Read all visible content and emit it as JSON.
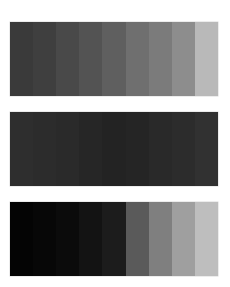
{
  "figure": {
    "background": "#ffffff",
    "strips": [
      {
        "name": "top-gray-ramp",
        "top": 22,
        "bands": [
          "#3a3a3a",
          "#3f3f3f",
          "#494949",
          "#535353",
          "#5f5f5f",
          "#6f6f6f",
          "#7b7b7b",
          "#8d8d8d",
          "#b9b9b9"
        ]
      },
      {
        "name": "middle-dark-ramp",
        "top": 112,
        "bands": [
          "#2e2e2e",
          "#2c2c2c",
          "#2a2a2a",
          "#262626",
          "#232323",
          "#252525",
          "#292929",
          "#2c2c2c",
          "#313131"
        ]
      },
      {
        "name": "bottom-black-to-light-ramp",
        "top": 202,
        "bands": [
          "#040404",
          "#070707",
          "#0b0b0b",
          "#131313",
          "#1c1c1c",
          "#5a5a5a",
          "#7f7f7f",
          "#9f9f9f",
          "#bebebe"
        ]
      }
    ]
  }
}
